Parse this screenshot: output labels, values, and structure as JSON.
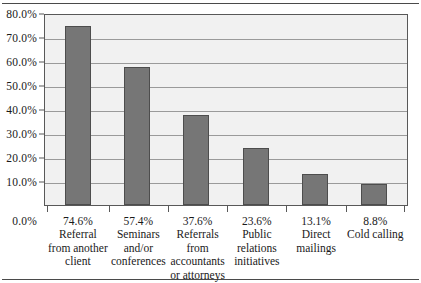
{
  "figure": {
    "background": "#ffffff",
    "rule_color": "#4a4a4a",
    "plot_background": "#f1f1f1",
    "gridline_color": "#9a9a9a",
    "axis_color": "#585858",
    "bar_fill": "#767676",
    "bar_border": "#4d4d4d"
  },
  "chart_data": {
    "type": "bar",
    "title": "",
    "xlabel": "",
    "ylabel": "",
    "ylim": [
      0,
      80
    ],
    "grid": true,
    "legend": false,
    "y_tick_labels": [
      "80.0%",
      "70.0%",
      "60.0%",
      "50.0%",
      "40.0%",
      "30.0%",
      "20.0%",
      "10.0%",
      "0.0%"
    ],
    "y_tick_values": [
      80,
      70,
      60,
      50,
      40,
      30,
      20,
      10,
      0
    ],
    "categories": [
      "Referral from another client",
      "Seminars and/or conferences",
      "Referrals from accountants or attorneys",
      "Public relations initiatives",
      "Direct mailings",
      "Cold calling"
    ],
    "values": [
      74.6,
      57.4,
      37.6,
      23.6,
      13.1,
      8.8
    ],
    "value_labels": [
      "74.6%",
      "57.4%",
      "37.6%",
      "23.6%",
      "13.1%",
      "8.8%"
    ],
    "category_label_lines": [
      [
        "Referral",
        "from another",
        "client"
      ],
      [
        "Seminars",
        "and/or",
        "conferences"
      ],
      [
        "Referrals",
        "from",
        "accountants",
        "or attorneys"
      ],
      [
        "Public",
        "relations",
        "initiatives"
      ],
      [
        "Direct",
        "mailings"
      ],
      [
        "Cold calling"
      ]
    ]
  }
}
